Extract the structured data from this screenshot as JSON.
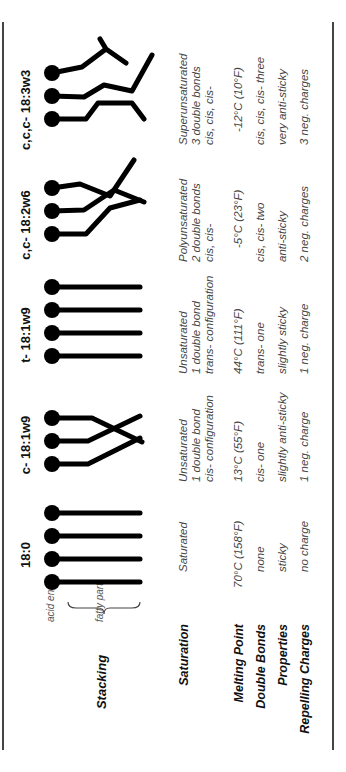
{
  "row_labels": {
    "stacking": "Stacking",
    "saturation": "Saturation",
    "melting_point": "Melting Point",
    "double_bonds": "Double Bonds",
    "properties": "Properties",
    "repelling_charges": "Repelling Charges"
  },
  "annotations": {
    "acid_end": "acid end",
    "fatty_part": "fatty part"
  },
  "columns": [
    {
      "name": "18:0",
      "molecule_count": 4,
      "shape": "straight",
      "saturation": [
        "Saturated"
      ],
      "melting_point": "70°C (158°F)",
      "double_bonds": "none",
      "properties": "sticky",
      "repelling_charges": "no charge"
    },
    {
      "name": "c- 18:1w9",
      "molecule_count": 3,
      "shape": "single-cis-kink",
      "saturation": [
        "Unsaturated",
        "1 double bond",
        "cis- configuration"
      ],
      "melting_point": "13°C (55°F)",
      "double_bonds": "cis- one",
      "properties": "slightly anti-sticky",
      "repelling_charges": "1 neg. charge"
    },
    {
      "name": "t- 18:1w9",
      "molecule_count": 4,
      "shape": "straight",
      "saturation": [
        "Unsaturated",
        "1 double bond",
        "trans- configuration"
      ],
      "melting_point": "44°C (111°F)",
      "double_bonds": "trans- one",
      "properties": "slightly sticky",
      "repelling_charges": "1 neg. charge"
    },
    {
      "name": "c,c- 18:2w6",
      "molecule_count": 3,
      "shape": "double-cis-kink",
      "saturation": [
        "Polyunsaturated",
        "2 double bonds",
        "cis, cis-"
      ],
      "melting_point": "-5°C (23°F)",
      "double_bonds": "cis, cis- two",
      "properties": "anti-sticky",
      "repelling_charges": "2 neg. charges"
    },
    {
      "name": "c,c,c- 18:3w3",
      "molecule_count": 3,
      "shape": "triple-cis-kink",
      "saturation": [
        "Superunsaturated",
        "3 double bonds",
        "cis, cis, cis-"
      ],
      "melting_point": "-12°C (10°F)",
      "double_bonds": "cis, cis, cis- three",
      "properties": "very anti-sticky",
      "repelling_charges": "3 neg. charges"
    }
  ]
}
